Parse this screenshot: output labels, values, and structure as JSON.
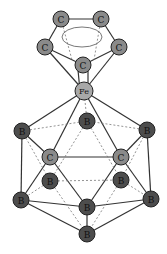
{
  "diagram": {
    "colors": {
      "carbon_fill": "#8a8a8a",
      "boron_fill": "#4d4d4d",
      "iron_fill": "#a8a8a8",
      "bond": "#333333",
      "dashed_bond": "#777777",
      "background": "#ffffff"
    },
    "atoms": [
      {
        "id": "cp1",
        "label": "C",
        "x": 61,
        "y": 19,
        "type": "carbon"
      },
      {
        "id": "cp2",
        "label": "C",
        "x": 101,
        "y": 19,
        "type": "carbon"
      },
      {
        "id": "cp3",
        "label": "C",
        "x": 45,
        "y": 47,
        "type": "carbon"
      },
      {
        "id": "cp4",
        "label": "C",
        "x": 119,
        "y": 47,
        "type": "carbon"
      },
      {
        "id": "cp5",
        "label": "C",
        "x": 83,
        "y": 65,
        "type": "carbon"
      },
      {
        "id": "fe",
        "label": "Fe",
        "x": 84,
        "y": 91,
        "type": "iron"
      },
      {
        "id": "b1",
        "label": "B",
        "x": 87,
        "y": 121,
        "type": "boron"
      },
      {
        "id": "b2",
        "label": "B",
        "x": 22,
        "y": 131,
        "type": "boron"
      },
      {
        "id": "b3",
        "label": "B",
        "x": 147,
        "y": 130,
        "type": "boron"
      },
      {
        "id": "c1",
        "label": "C",
        "x": 50,
        "y": 157,
        "type": "carbon"
      },
      {
        "id": "c2",
        "label": "C",
        "x": 121,
        "y": 157,
        "type": "carbon"
      },
      {
        "id": "b4",
        "label": "B",
        "x": 50,
        "y": 181,
        "type": "boron"
      },
      {
        "id": "b5",
        "label": "B",
        "x": 121,
        "y": 180,
        "type": "boron"
      },
      {
        "id": "b6",
        "label": "B",
        "x": 21,
        "y": 200,
        "type": "boron"
      },
      {
        "id": "b7",
        "label": "B",
        "x": 87,
        "y": 207,
        "type": "boron"
      },
      {
        "id": "b8",
        "label": "B",
        "x": 151,
        "y": 199,
        "type": "boron"
      },
      {
        "id": "b9",
        "label": "B",
        "x": 87,
        "y": 234,
        "type": "boron"
      }
    ]
  }
}
